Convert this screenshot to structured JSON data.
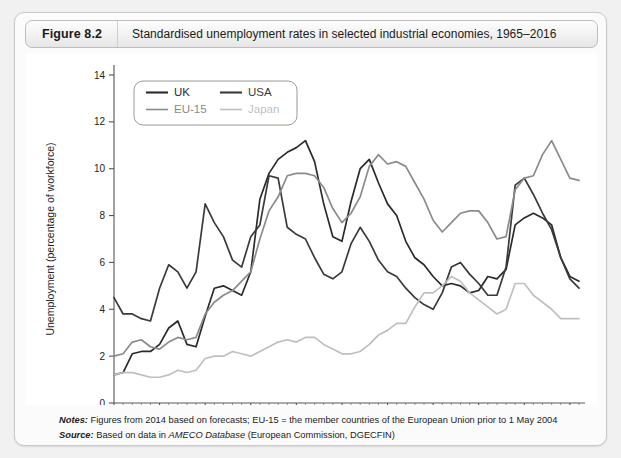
{
  "figure": {
    "number": "Figure 8.2",
    "caption": "Standardised unemployment rates in selected industrial economies, 1965–2016"
  },
  "notes": {
    "notes_label": "Notes:",
    "notes_text": " Figures from 2014 based on forecasts; EU-15 = the member countries of the European Union prior to 1 May 2004",
    "source_label": "Source:",
    "source_pre": " Based on data in ",
    "source_em": "AMECO Database",
    "source_post": " (European Commission, DGECFIN)"
  },
  "chart_data": {
    "type": "line",
    "title": "Standardised unemployment rates in selected industrial economies, 1965–2016",
    "xlabel": "",
    "ylabel": "Unemployment (percentage of workforce)",
    "xlim": [
      1965,
      2016
    ],
    "ylim": [
      0,
      14
    ],
    "ytick_step": 2,
    "yticks": [
      0,
      2,
      4,
      6,
      8,
      10,
      12,
      14
    ],
    "xticks": [
      1965,
      1970,
      1975,
      1980,
      1985,
      1990,
      1995,
      2000,
      2005,
      2010,
      2015
    ],
    "xtick_minor_step": 1,
    "grid": false,
    "legend_position": "top-left",
    "x": [
      1965,
      1966,
      1967,
      1968,
      1969,
      1970,
      1971,
      1972,
      1973,
      1974,
      1975,
      1976,
      1977,
      1978,
      1979,
      1980,
      1981,
      1982,
      1983,
      1984,
      1985,
      1986,
      1987,
      1988,
      1989,
      1990,
      1991,
      1992,
      1993,
      1994,
      1995,
      1996,
      1997,
      1998,
      1999,
      2000,
      2001,
      2002,
      2003,
      2004,
      2005,
      2006,
      2007,
      2008,
      2009,
      2010,
      2011,
      2012,
      2013,
      2014,
      2015,
      2016
    ],
    "series": [
      {
        "name": "UK",
        "color": "#2b2b2b",
        "width": 1.7,
        "values": [
          1.2,
          1.3,
          2.1,
          2.2,
          2.2,
          2.5,
          3.2,
          3.5,
          2.5,
          2.4,
          3.7,
          4.9,
          5.0,
          4.8,
          4.6,
          5.6,
          8.7,
          9.8,
          10.4,
          10.7,
          10.9,
          11.2,
          10.3,
          8.5,
          7.1,
          6.9,
          8.6,
          10.0,
          10.4,
          9.4,
          8.5,
          8.0,
          6.9,
          6.2,
          5.9,
          5.4,
          5.0,
          5.1,
          5.0,
          4.7,
          4.8,
          5.4,
          5.3,
          5.7,
          7.6,
          7.9,
          8.1,
          7.9,
          7.6,
          6.2,
          5.4,
          5.2
        ]
      },
      {
        "name": "USA",
        "color": "#3a3a3a",
        "width": 1.7,
        "values": [
          4.5,
          3.8,
          3.8,
          3.6,
          3.5,
          4.9,
          5.9,
          5.6,
          4.9,
          5.6,
          8.5,
          7.7,
          7.1,
          6.1,
          5.8,
          7.1,
          7.6,
          9.7,
          9.6,
          7.5,
          7.2,
          7.0,
          6.2,
          5.5,
          5.3,
          5.6,
          6.8,
          7.5,
          6.9,
          6.1,
          5.6,
          5.4,
          4.9,
          4.5,
          4.2,
          4.0,
          4.7,
          5.8,
          6.0,
          5.5,
          5.1,
          4.6,
          4.6,
          5.8,
          9.3,
          9.6,
          8.9,
          8.1,
          7.4,
          6.2,
          5.3,
          4.9
        ]
      },
      {
        "name": "EU-15",
        "color": "#8b8b8b",
        "width": 1.7,
        "values": [
          2.0,
          2.1,
          2.6,
          2.7,
          2.4,
          2.3,
          2.6,
          2.8,
          2.7,
          2.8,
          3.8,
          4.3,
          4.6,
          4.8,
          5.2,
          5.6,
          7.0,
          8.2,
          8.8,
          9.7,
          9.8,
          9.8,
          9.7,
          9.2,
          8.3,
          7.7,
          8.1,
          8.8,
          10.1,
          10.6,
          10.2,
          10.3,
          10.1,
          9.4,
          8.7,
          7.8,
          7.3,
          7.7,
          8.1,
          8.2,
          8.2,
          7.7,
          7.0,
          7.1,
          9.1,
          9.6,
          9.7,
          10.6,
          11.2,
          10.4,
          9.6,
          9.5
        ]
      },
      {
        "name": "Japan",
        "color": "#bfbfbf",
        "width": 1.7,
        "values": [
          1.2,
          1.3,
          1.3,
          1.2,
          1.1,
          1.1,
          1.2,
          1.4,
          1.3,
          1.4,
          1.9,
          2.0,
          2.0,
          2.2,
          2.1,
          2.0,
          2.2,
          2.4,
          2.6,
          2.7,
          2.6,
          2.8,
          2.8,
          2.5,
          2.3,
          2.1,
          2.1,
          2.2,
          2.5,
          2.9,
          3.1,
          3.4,
          3.4,
          4.1,
          4.7,
          4.7,
          5.0,
          5.4,
          5.2,
          4.7,
          4.4,
          4.1,
          3.8,
          4.0,
          5.1,
          5.1,
          4.6,
          4.3,
          4.0,
          3.6,
          3.6,
          3.6
        ]
      }
    ]
  },
  "legend": {
    "entries": [
      {
        "label": "UK",
        "color": "#2b2b2b"
      },
      {
        "label": "USA",
        "color": "#3a3a3a"
      },
      {
        "label": "EU-15",
        "color": "#8b8b8b"
      },
      {
        "label": "Japan",
        "color": "#bfbfbf"
      }
    ]
  }
}
